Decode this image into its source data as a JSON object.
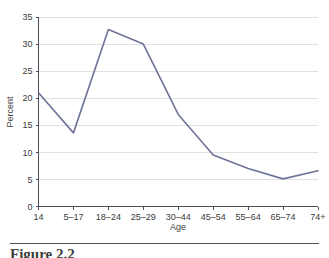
{
  "figure": {
    "caption_partial": "Figure 2.2"
  },
  "chart_data": {
    "type": "line",
    "title": "",
    "xlabel": "Age",
    "ylabel": "Percent",
    "categories": [
      "14",
      "5–17",
      "18–24",
      "25–29",
      "30–44",
      "45–54",
      "55–64",
      "65–74",
      "74+"
    ],
    "values": [
      21.0,
      13.6,
      32.7,
      30.0,
      17.0,
      9.5,
      7.0,
      5.1,
      6.6
    ],
    "series": [
      {
        "name": "Percent",
        "values": [
          21.0,
          13.6,
          32.7,
          30.0,
          17.0,
          9.5,
          7.0,
          5.1,
          6.6
        ]
      }
    ],
    "ylim": [
      0,
      35
    ],
    "yticks": [
      0,
      5,
      10,
      15,
      20,
      25,
      30,
      35
    ],
    "ytick_labels": [
      "0",
      "5",
      "10",
      "15",
      "20",
      "25",
      "30",
      "35"
    ],
    "grid": "horizontal",
    "legend": "none",
    "line_color": "#6e7398",
    "grid_color": "#d9d9d9",
    "axis_color": "#4d4d57",
    "background": "#ffffff"
  }
}
